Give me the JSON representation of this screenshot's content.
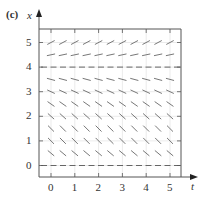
{
  "panel_label": "(c)",
  "axes": {
    "x_axis_name": "t",
    "y_axis_name": "x",
    "t_ticks": [
      "0",
      "1",
      "2",
      "3",
      "4",
      "5"
    ],
    "x_ticks": [
      "0",
      "1",
      "2",
      "3",
      "4",
      "5"
    ]
  },
  "colors": {
    "axis": "#555555",
    "grid": "#dddddd",
    "segment": "#777777",
    "equilibrium": "#666666"
  },
  "chart_data": {
    "type": "slope_field",
    "title": "(c)",
    "xlabel": "t",
    "ylabel": "x",
    "xlim": [
      -0.5,
      5.5
    ],
    "ylim": [
      -0.5,
      5.4
    ],
    "grid": true,
    "t_samples": [
      0,
      0.5,
      1,
      1.5,
      2,
      2.5,
      3,
      3.5,
      4,
      4.5,
      5
    ],
    "rows": [
      {
        "x": 5,
        "angle_deg": 28
      },
      {
        "x": 4.5,
        "angle_deg": 12
      },
      {
        "x": 4,
        "angle_deg": 0,
        "equilibrium": true
      },
      {
        "x": 3.5,
        "angle_deg": -15
      },
      {
        "x": 3,
        "angle_deg": -25
      },
      {
        "x": 2.5,
        "angle_deg": -35
      },
      {
        "x": 2,
        "angle_deg": -42
      },
      {
        "x": 1.5,
        "angle_deg": -45
      },
      {
        "x": 1,
        "angle_deg": -45
      },
      {
        "x": 0.5,
        "angle_deg": -40
      },
      {
        "x": 0,
        "angle_deg": 0,
        "equilibrium": true
      }
    ],
    "equilibria": [
      0,
      4
    ],
    "annotations": [
      "Slopes positive above x=4, negative between 0 and 4, zero at x=0 and x=4"
    ]
  }
}
